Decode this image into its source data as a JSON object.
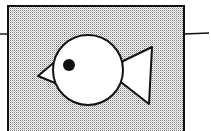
{
  "illustration": {
    "subject": "fish-in-box",
    "colors": {
      "ink": "#111111",
      "paper": "#ffffff",
      "stipple": "#9a9a9a"
    },
    "box": {
      "x": 8,
      "y": 6,
      "w": 176,
      "h": 130
    },
    "left_line": {
      "x1": 0,
      "y1": 34,
      "x2": 8,
      "y2": 34
    },
    "right_line": {
      "x1": 184,
      "y1": 34,
      "x2": 209,
      "y2": 33
    },
    "body": {
      "cx": 88,
      "cy": 70,
      "r": 35
    },
    "eye": {
      "cx": 69,
      "cy": 65,
      "r": 6
    },
    "beak_points": "38,76 57,60 60,85",
    "tail_points": "117,64 152,47 149,104 117,79"
  }
}
